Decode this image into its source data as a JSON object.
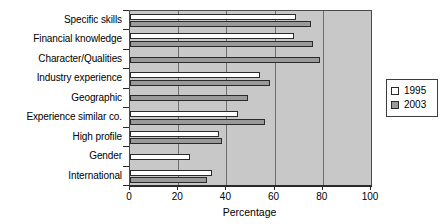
{
  "chart_data": {
    "type": "bar",
    "orientation": "horizontal",
    "title": "",
    "xlabel": "Percentage",
    "ylabel": "",
    "xlim": [
      0,
      100
    ],
    "xticks": [
      0,
      20,
      40,
      60,
      80,
      100
    ],
    "grid": true,
    "grid_axis": "x",
    "legend_position": "right",
    "categories": [
      "Specific skills",
      "Financial knowledge",
      "Character/Qualities",
      "Industry experience",
      "Geographic",
      "Experience similar co.",
      "High profile",
      "Gender",
      "International"
    ],
    "series": [
      {
        "name": "1995",
        "color": "#ffffff",
        "values": [
          69,
          68,
          null,
          54,
          null,
          45,
          37,
          25,
          34
        ]
      },
      {
        "name": "2003",
        "color": "#9a9a9a",
        "values": [
          75,
          76,
          79,
          58,
          49,
          56,
          38,
          null,
          32
        ]
      }
    ]
  },
  "legend": {
    "entries": [
      {
        "label": "1995",
        "swatch": "white-square"
      },
      {
        "label": "2003",
        "swatch": "gray-square"
      }
    ]
  },
  "axis": {
    "x_title": "Percentage",
    "tick_labels": [
      "0",
      "20",
      "40",
      "60",
      "80",
      "100"
    ]
  },
  "colors": {
    "plot_background": "#c8c8c8",
    "series_1995": "#ffffff",
    "series_2003": "#9a9a9a",
    "gridline": "#6e6e6e",
    "axis": "#2a2a2a",
    "text": "#000000"
  }
}
